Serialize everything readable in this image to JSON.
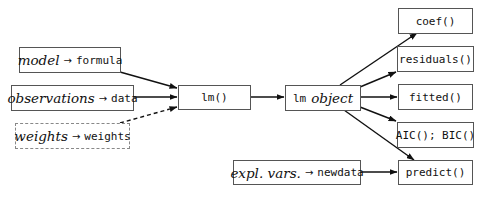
{
  "inputs": {
    "model": {
      "concept": "model",
      "arrow": "→",
      "arg": "formula"
    },
    "observations": {
      "concept": "observations",
      "arrow": "→",
      "arg": "data"
    },
    "weights": {
      "concept": "weights",
      "arrow": "→",
      "arg": "weights"
    },
    "explvars": {
      "concept": "expl. vars.",
      "arrow": "→",
      "arg": "newdata"
    }
  },
  "center": {
    "fn": "lm()",
    "object_code": "lm",
    "object_label": "object"
  },
  "outputs": [
    {
      "label": "coef()"
    },
    {
      "label": "residuals()"
    },
    {
      "label": "fitted()"
    },
    {
      "label": "AIC(); BIC()"
    },
    {
      "label": "predict()"
    }
  ],
  "edges": [
    {
      "from": "model",
      "to": "lm()",
      "style": "solid"
    },
    {
      "from": "observations",
      "to": "lm()",
      "style": "solid"
    },
    {
      "from": "weights",
      "to": "lm()",
      "style": "dashed"
    },
    {
      "from": "lm()",
      "to": "lm object",
      "style": "solid"
    },
    {
      "from": "lm object",
      "to": "coef()",
      "style": "solid"
    },
    {
      "from": "lm object",
      "to": "residuals()",
      "style": "solid"
    },
    {
      "from": "lm object",
      "to": "fitted()",
      "style": "solid"
    },
    {
      "from": "lm object",
      "to": "AIC(); BIC()",
      "style": "solid"
    },
    {
      "from": "lm object",
      "to": "predict()",
      "style": "solid"
    },
    {
      "from": "explvars",
      "to": "predict()",
      "style": "solid"
    }
  ]
}
